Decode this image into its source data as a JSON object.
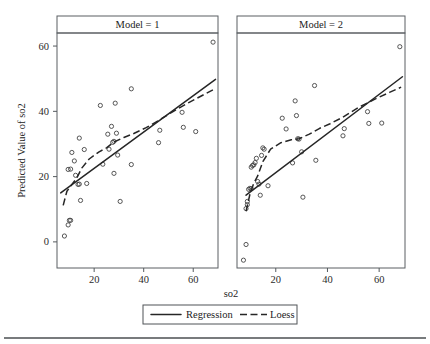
{
  "figure": {
    "background": "#ffffff",
    "line_color": "#262626",
    "point_color": "#3a3a3a",
    "frame_color": "#5a5f63"
  },
  "chart_data": {
    "type": "scatter",
    "title": "",
    "xlabel": "so2",
    "ylabel": "Predicted Value of so2",
    "xlim": [
      5,
      70
    ],
    "ylim": [
      -8,
      64
    ],
    "xticks": [
      20,
      40,
      60
    ],
    "yticks": [
      0,
      20,
      40,
      60
    ],
    "grid": false,
    "legend_position": "bottom",
    "legend": [
      {
        "label": "Regression",
        "style": "solid"
      },
      {
        "label": "Loess",
        "style": "dashed"
      }
    ],
    "panels": [
      {
        "strip_label": "Model = 1",
        "points": [
          [
            8,
            1.8
          ],
          [
            9.5,
            5.2
          ],
          [
            10,
            6.6
          ],
          [
            10.5,
            6.6
          ],
          [
            9.5,
            22.2
          ],
          [
            10.5,
            22.3
          ],
          [
            11,
            27.4
          ],
          [
            12,
            24.8
          ],
          [
            12.5,
            20.4
          ],
          [
            13.5,
            17.6
          ],
          [
            14,
            17.7
          ],
          [
            14,
            31.8
          ],
          [
            14.5,
            12.7
          ],
          [
            16,
            28.3
          ],
          [
            17,
            17.9
          ],
          [
            22.5,
            41.8
          ],
          [
            23.5,
            23.8
          ],
          [
            25.5,
            33.0
          ],
          [
            26,
            28.4
          ],
          [
            27,
            35.4
          ],
          [
            27.5,
            30.5
          ],
          [
            28,
            30.8
          ],
          [
            28.5,
            42.5
          ],
          [
            29,
            33.3
          ],
          [
            29.5,
            26.6
          ],
          [
            28,
            21.0
          ],
          [
            30.5,
            12.4
          ],
          [
            35,
            46.9
          ],
          [
            35,
            23.7
          ],
          [
            46,
            30.4
          ],
          [
            46.5,
            34.2
          ],
          [
            55.5,
            39.7
          ],
          [
            56,
            35.1
          ],
          [
            61,
            33.8
          ],
          [
            68,
            61.2
          ]
        ],
        "regression_line": [
          [
            6.5,
            15.0
          ],
          [
            69,
            49.8
          ]
        ],
        "loess_line": [
          [
            7.5,
            11.2
          ],
          [
            9,
            15.5
          ],
          [
            11,
            17.6
          ],
          [
            13,
            19.6
          ],
          [
            15,
            22.6
          ],
          [
            18,
            25.4
          ],
          [
            22,
            27.6
          ],
          [
            25,
            28.8
          ],
          [
            28,
            30.6
          ],
          [
            32,
            32.0
          ],
          [
            36,
            33.2
          ],
          [
            41,
            35.0
          ],
          [
            46,
            37.2
          ],
          [
            52,
            40.0
          ],
          [
            58,
            42.6
          ],
          [
            64,
            45.0
          ],
          [
            68.5,
            46.8
          ]
        ]
      },
      {
        "strip_label": "Model = 2",
        "points": [
          [
            7.5,
            -5.6
          ],
          [
            8.5,
            -0.8
          ],
          [
            8.5,
            10.2
          ],
          [
            9,
            11.4
          ],
          [
            9,
            12.4
          ],
          [
            9.5,
            16.1
          ],
          [
            10,
            16.4
          ],
          [
            10.5,
            16.3
          ],
          [
            10.5,
            22.9
          ],
          [
            11,
            23.4
          ],
          [
            11.5,
            23.6
          ],
          [
            12,
            24.3
          ],
          [
            12.5,
            25.6
          ],
          [
            13,
            18.5
          ],
          [
            13.5,
            17.7
          ],
          [
            14,
            14.3
          ],
          [
            14.5,
            26.5
          ],
          [
            15,
            28.8
          ],
          [
            15.5,
            28.4
          ],
          [
            17,
            17.2
          ],
          [
            22.5,
            37.9
          ],
          [
            24,
            34.6
          ],
          [
            26.5,
            24.2
          ],
          [
            27.5,
            43.2
          ],
          [
            28,
            38.7
          ],
          [
            28.5,
            31.6
          ],
          [
            29,
            31.5
          ],
          [
            30,
            27.6
          ],
          [
            30.5,
            13.7
          ],
          [
            35,
            47.9
          ],
          [
            35.5,
            25.0
          ],
          [
            46,
            32.5
          ],
          [
            46.5,
            34.7
          ],
          [
            55.5,
            39.9
          ],
          [
            56,
            36.3
          ],
          [
            61,
            36.4
          ],
          [
            68,
            59.8
          ]
        ],
        "regression_line": [
          [
            8.5,
            14.3
          ],
          [
            69,
            50.6
          ]
        ],
        "loess_line": [
          [
            8.5,
            9.4
          ],
          [
            10,
            14.6
          ],
          [
            11.5,
            18.0
          ],
          [
            13,
            20.2
          ],
          [
            15,
            24.6
          ],
          [
            18,
            28.4
          ],
          [
            22,
            30.4
          ],
          [
            26,
            31.3
          ],
          [
            29,
            31.6
          ],
          [
            33,
            33.0
          ],
          [
            37,
            34.8
          ],
          [
            41,
            36.2
          ],
          [
            46,
            38.2
          ],
          [
            52,
            41.2
          ],
          [
            58,
            43.6
          ],
          [
            64,
            45.8
          ],
          [
            68.5,
            47.4
          ]
        ]
      }
    ]
  }
}
